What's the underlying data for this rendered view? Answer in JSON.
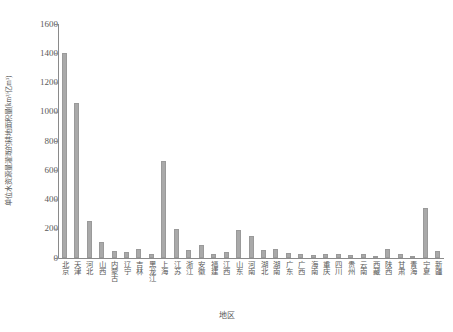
{
  "chart_data": {
    "type": "bar",
    "title": "",
    "xlabel": "地区",
    "ylabel": "单位水资源量灌溉的耕地面积量(km²/亿m³)",
    "ylim": [
      0,
      1600
    ],
    "yticks": [
      0,
      200,
      400,
      600,
      800,
      1000,
      1200,
      1400,
      1600
    ],
    "grid": false,
    "legend": "none",
    "bar_color": "#a9a9a9",
    "categories": [
      "北京",
      "天津",
      "河北",
      "山西",
      "内蒙古",
      "辽宁",
      "吉林",
      "黑龙江",
      "上海",
      "江苏",
      "浙江",
      "安徽",
      "福建",
      "江西",
      "山东",
      "河南",
      "湖北",
      "湖南",
      "广东",
      "广西",
      "海南",
      "重庆",
      "四川",
      "贵州",
      "云南",
      "西藏",
      "陕西",
      "甘肃",
      "青海",
      "宁夏",
      "新疆"
    ],
    "values": [
      1400,
      1060,
      255,
      110,
      48,
      38,
      62,
      30,
      660,
      195,
      52,
      88,
      30,
      40,
      190,
      148,
      58,
      60,
      35,
      28,
      22,
      30,
      28,
      20,
      25,
      8,
      62,
      30,
      12,
      345,
      45
    ]
  }
}
